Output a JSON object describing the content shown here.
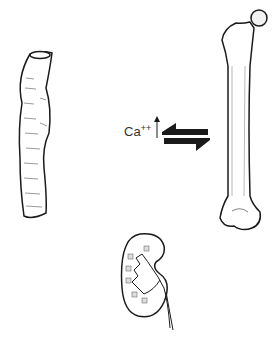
{
  "diagram": {
    "type": "calcium-homeostasis-illustration",
    "label": {
      "ion": "Ca",
      "charge": "++",
      "direction": "increase"
    },
    "elements": [
      {
        "name": "intestine",
        "position": "left"
      },
      {
        "name": "femur-bone",
        "position": "right"
      },
      {
        "name": "kidney",
        "position": "bottom-center"
      },
      {
        "name": "bidirectional-arrow",
        "position": "center",
        "between": [
          "blood-calcium",
          "bone"
        ]
      }
    ],
    "colors": {
      "ink": "#1a1a1a",
      "background": "#ffffff",
      "text": "#333333"
    }
  }
}
